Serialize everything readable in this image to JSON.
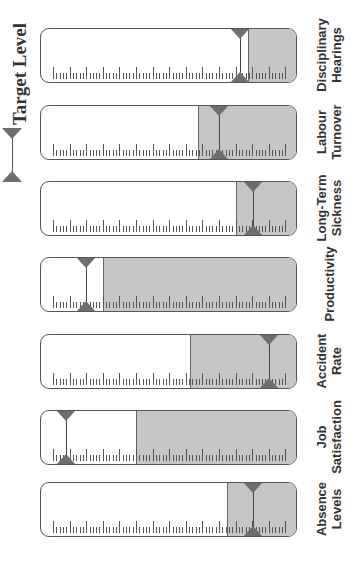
{
  "chart_data": {
    "type": "gauge-bar",
    "orientation": "rotated-90",
    "legend": {
      "label": "Target Level",
      "marker": "paired-triangles"
    },
    "scale": {
      "min": 0,
      "max": 1,
      "major_ticks": 15,
      "minor_per_major": 5
    },
    "gauges": [
      {
        "name": "Disciplinary Hearings",
        "line1": "Disciplinary",
        "line2": "Hearings",
        "top": 28,
        "fill_start": 0.805,
        "target": 0.774
      },
      {
        "name": "Labour Turnover",
        "line1": "Labour",
        "line2": "Turnover",
        "top": 105,
        "fill_start": 0.611,
        "target": 0.693
      },
      {
        "name": "Long-Term Sickness",
        "line1": "Long-Term",
        "line2": "Sickness",
        "top": 181,
        "fill_start": 0.759,
        "target": 0.825
      },
      {
        "name": "Productivity",
        "line1": "Productivity",
        "line2": "",
        "top": 257,
        "fill_start": 0.241,
        "target": 0.175
      },
      {
        "name": "Accident Rate",
        "line1": "Accident",
        "line2": "Rate",
        "top": 334,
        "fill_start": 0.58,
        "target": 0.887
      },
      {
        "name": "Job Satisfaction",
        "line1": "Job",
        "line2": "Satisfaction",
        "top": 410,
        "fill_start": 0.37,
        "target": 0.097
      },
      {
        "name": "Absence Levels",
        "line1": "Absence",
        "line2": "Levels",
        "top": 482,
        "fill_start": 0.724,
        "target": 0.825
      }
    ],
    "colors": {
      "fill": "#c6c6c6",
      "marker": "#6e6e6e",
      "border": "#555555"
    }
  },
  "legend": {
    "title": "Target Level"
  }
}
